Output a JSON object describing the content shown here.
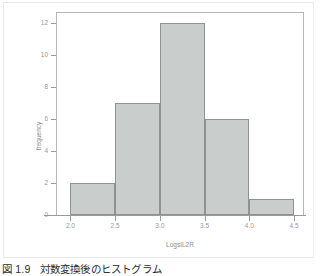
{
  "figure": {
    "caption_number": "図 1.9",
    "caption_text": "対数変換後のヒストグラム"
  },
  "chart_data": {
    "type": "bar",
    "title": "",
    "xlabel": "LogsIL2R",
    "ylabel": "frequency",
    "categories": [
      "2.0-2.5",
      "2.5-3.0",
      "3.0-3.5",
      "3.5-4.0",
      "4.0-4.5"
    ],
    "bin_edges": [
      2.0,
      2.5,
      3.0,
      3.5,
      4.0,
      4.5
    ],
    "values": [
      2,
      7,
      12,
      6,
      1
    ],
    "xlim": [
      1.85,
      4.6
    ],
    "ylim": [
      0,
      12.6
    ],
    "xticks": [
      "2.0",
      "2.5",
      "3.0",
      "3.5",
      "4.0",
      "4.5"
    ],
    "xtick_values": [
      2.0,
      2.5,
      3.0,
      3.5,
      4.0,
      4.5
    ],
    "yticks": [
      "0",
      "2",
      "4",
      "6",
      "8",
      "10",
      "12"
    ],
    "ytick_values": [
      0,
      2,
      4,
      6,
      8,
      10,
      12
    ],
    "grid": false,
    "legend": "none",
    "bar_fill_color": "#c9cdcc",
    "bar_edge_color": "#8e9392",
    "axis_color": "#9a9a9a",
    "frame_color": "#b6b6b6"
  }
}
